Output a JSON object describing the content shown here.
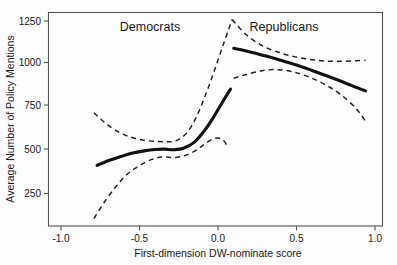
{
  "chart_data": {
    "type": "line",
    "title": "",
    "xlabel": "First-dimension DW-nominate score",
    "ylabel": "Average Number of Policy Mentions",
    "xlim": [
      -1.2,
      1.15
    ],
    "ylim": [
      100,
      1300
    ],
    "xticks": [
      -1.0,
      -0.5,
      0.0,
      0.5,
      1.0
    ],
    "xtick_labels": [
      "-1.0",
      "-0.5",
      "0.0",
      "0.5",
      "1.0"
    ],
    "yticks": [
      250,
      500,
      750,
      1000,
      1250
    ],
    "ytick_labels": [
      "250",
      "500",
      "750",
      "1000",
      "1250"
    ],
    "grid": false,
    "legend_position": "none",
    "annotations": [
      {
        "name": "democrats-label",
        "text": "Democrats",
        "x": -0.38,
        "y": 1235
      },
      {
        "name": "republicans-label",
        "text": "Republicans",
        "x": 0.42,
        "y": 1235
      }
    ],
    "series": [
      {
        "name": "Democrats fitted line",
        "style": "solid",
        "color": "#111111",
        "x": [
          -0.77,
          -0.7,
          -0.62,
          -0.55,
          -0.47,
          -0.4,
          -0.34,
          -0.28,
          -0.22,
          -0.15,
          -0.09,
          -0.03,
          0.03,
          0.08
        ],
        "y": [
          413,
          440,
          464,
          483,
          497,
          505,
          507,
          504,
          512,
          548,
          610,
          690,
          782,
          855
        ]
      },
      {
        "name": "Democrats upper confidence bound",
        "style": "dashed",
        "color": "#222222",
        "x": [
          -0.79,
          -0.72,
          -0.64,
          -0.56,
          -0.48,
          -0.4,
          -0.33,
          -0.27,
          -0.2,
          -0.14,
          -0.08,
          -0.02,
          0.04,
          0.09
        ],
        "y": [
          718,
          660,
          610,
          578,
          560,
          552,
          550,
          555,
          600,
          690,
          820,
          970,
          1130,
          1258
        ]
      },
      {
        "name": "Democrats lower confidence bound",
        "style": "dashed",
        "color": "#222222",
        "x": [
          -0.79,
          -0.72,
          -0.65,
          -0.58,
          -0.5,
          -0.42,
          -0.35,
          -0.28,
          -0.21,
          -0.14,
          -0.08,
          -0.02,
          0.03,
          0.06
        ],
        "y": [
          105,
          205,
          290,
          360,
          412,
          448,
          462,
          458,
          470,
          500,
          540,
          570,
          562,
          522
        ]
      },
      {
        "name": "Republicans fitted line",
        "style": "solid",
        "color": "#111111",
        "x": [
          0.1,
          0.2,
          0.3,
          0.4,
          0.5,
          0.6,
          0.7,
          0.8,
          0.9,
          0.94
        ],
        "y": [
          1092,
          1072,
          1048,
          1022,
          995,
          963,
          930,
          895,
          858,
          845
        ]
      },
      {
        "name": "Republicans upper confidence bound",
        "style": "dashed",
        "color": "#222222",
        "x": [
          0.09,
          0.18,
          0.28,
          0.38,
          0.48,
          0.58,
          0.68,
          0.78,
          0.88,
          0.94
        ],
        "y": [
          1258,
          1170,
          1108,
          1070,
          1045,
          1028,
          1018,
          1016,
          1020,
          1022
        ]
      },
      {
        "name": "Republicans lower confidence bound",
        "style": "dashed",
        "color": "#222222",
        "x": [
          0.1,
          0.18,
          0.28,
          0.38,
          0.48,
          0.58,
          0.68,
          0.78,
          0.88,
          0.94
        ],
        "y": [
          918,
          940,
          962,
          968,
          955,
          925,
          882,
          825,
          742,
          668
        ]
      }
    ]
  }
}
